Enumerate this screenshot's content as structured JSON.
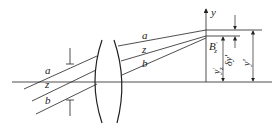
{
  "diagram": {
    "type": "optical-ray-diagram",
    "rays": [
      {
        "label": "a",
        "name": "upper-ray"
      },
      {
        "label": "z",
        "name": "chief-ray"
      },
      {
        "label": "b",
        "name": "lower-ray"
      }
    ],
    "labels": {
      "ray_a": "a",
      "ray_z": "z",
      "ray_b": "b",
      "axis_y": "y",
      "point": "B",
      "point_prime": "′",
      "point_sub": "z",
      "height_chief": "y",
      "height_chief_prime": "′",
      "height_chief_sub": "z",
      "delta_y": "δy′",
      "height_ideal": "y′"
    },
    "colors": {
      "line": "#222222",
      "background": "#ffffff"
    }
  }
}
